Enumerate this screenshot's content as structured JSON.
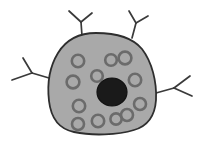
{
  "figure": {
    "type": "biological-cell-diagram",
    "canvas": {
      "width": 205,
      "height": 144,
      "background": "#ffffff"
    }
  },
  "colors": {
    "background": "#ffffff",
    "cytoplasm_fill": "#a9a9a9",
    "cell_outline": "#2e2e2e",
    "nucleus_fill": "#1a1a1a",
    "nucleus_outline": "#111111",
    "organelle_fill": "#a9a9a9",
    "organelle_ring": "#6b6b6b",
    "process_stroke": "#3a3a3a"
  },
  "cell_body": {
    "label": "cell-body",
    "outline_width": 1.8,
    "path": "M 96 33 C 78 33 66 40 58 53 C 50 66 47 84 49 101 C 51 118 59 129 74 132 C 92 136 118 135 134 130 C 148 126 155 115 156 100 C 157 82 152 62 142 49 C 132 37 114 33 96 33 Z"
  },
  "nucleus": {
    "label": "nucleus",
    "cx": 112,
    "cy": 92,
    "rx": 15,
    "ry": 14,
    "outline_width": 1.2
  },
  "organelles": {
    "label": "organelles",
    "ring_width": 2.6,
    "items": [
      {
        "id": "organelle-1",
        "cx": 78,
        "cy": 61,
        "r": 6.2
      },
      {
        "id": "organelle-2",
        "cx": 111,
        "cy": 60,
        "r": 5.8
      },
      {
        "id": "organelle-3",
        "cx": 125,
        "cy": 58,
        "r": 6.4
      },
      {
        "id": "organelle-4",
        "cx": 97,
        "cy": 76,
        "r": 5.8
      },
      {
        "id": "organelle-5",
        "cx": 73,
        "cy": 82,
        "r": 6.4
      },
      {
        "id": "organelle-6",
        "cx": 135,
        "cy": 80,
        "r": 6.2
      },
      {
        "id": "organelle-7",
        "cx": 140,
        "cy": 104,
        "r": 6.0
      },
      {
        "id": "organelle-8",
        "cx": 79,
        "cy": 106,
        "r": 6.2
      },
      {
        "id": "organelle-9",
        "cx": 127,
        "cy": 115,
        "r": 6.0
      },
      {
        "id": "organelle-10",
        "cx": 78,
        "cy": 124,
        "r": 6.0
      },
      {
        "id": "organelle-11",
        "cx": 98,
        "cy": 121,
        "r": 6.2
      },
      {
        "id": "organelle-12",
        "cx": 116,
        "cy": 119,
        "r": 5.6
      }
    ]
  },
  "processes": {
    "label": "branching-processes",
    "stroke_width": 1.7,
    "items": [
      {
        "id": "process-top-left",
        "trunk": "M 82 36 L 81 22",
        "branch_a": "M 81 22 L 69 11",
        "branch_b": "M 81 22 L 92 13"
      },
      {
        "id": "process-top-right",
        "trunk": "M 132 38 L 136 23",
        "branch_a": "M 136 23 L 129 11",
        "branch_b": "M 136 23 L 148 16"
      },
      {
        "id": "process-left",
        "trunk": "M 49 78 L 32 73",
        "branch_a": "M 32 73 L 23 58",
        "branch_b": "M 32 73 L 12 80"
      },
      {
        "id": "process-right",
        "trunk": "M 156 93 L 174 88",
        "branch_a": "M 174 88 L 190 76",
        "branch_b": "M 174 88 L 192 96"
      }
    ]
  }
}
